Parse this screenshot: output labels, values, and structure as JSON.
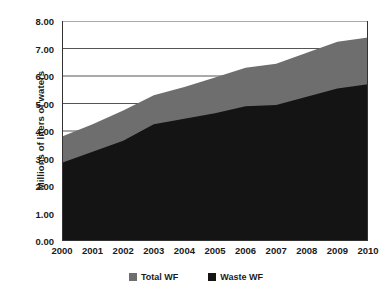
{
  "chart_data": {
    "type": "area",
    "title": "",
    "subtitle": "",
    "xlabel": "",
    "ylabel": "Millions of liters of waters",
    "categories": [
      "2000",
      "2001",
      "2002",
      "2003",
      "2004",
      "2005",
      "2006",
      "2007",
      "2008",
      "2009",
      "2010"
    ],
    "x": [
      2000,
      2001,
      2002,
      2003,
      2004,
      2005,
      2006,
      2007,
      2008,
      2009,
      2010
    ],
    "series": [
      {
        "name": "Total WF",
        "color": "#6e6e6e",
        "values": [
          3.8,
          4.25,
          4.75,
          5.3,
          5.6,
          5.95,
          6.3,
          6.45,
          6.85,
          7.25,
          7.4
        ]
      },
      {
        "name": "Waste WF",
        "color": "#141414",
        "values": [
          2.85,
          3.25,
          3.65,
          4.25,
          4.45,
          4.65,
          4.9,
          4.95,
          5.25,
          5.55,
          5.7
        ]
      }
    ],
    "ylim": [
      0.0,
      8.0
    ],
    "xlim": [
      2000,
      2010
    ],
    "ytick_labels": [
      "0.00",
      "1.00",
      "2.00",
      "3.00",
      "4.00",
      "5.00",
      "6.00",
      "7.00",
      "8.00"
    ],
    "ytick_values": [
      0,
      1,
      2,
      3,
      4,
      5,
      6,
      7,
      8
    ],
    "grid": "horizontal",
    "grid_color": "#555555",
    "legend_position": "bottom",
    "plot_background": "#ffffff",
    "axis_color": "#333333",
    "overlay_mode": "stacked-front"
  },
  "legend": {
    "entries": [
      {
        "label": "Total WF",
        "color": "#6e6e6e"
      },
      {
        "label": "Waste WF",
        "color": "#141414"
      }
    ]
  }
}
